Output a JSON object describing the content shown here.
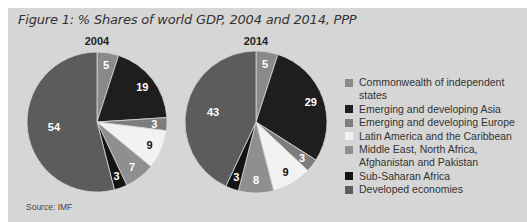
{
  "figure": {
    "title": "Figure 1: % Shares of world GDP, 2004 and 2014, PPP",
    "source": "Source: IMF"
  },
  "chart_data": [
    {
      "type": "pie",
      "title": "2004",
      "categories": [
        "Commonwealth of independent states",
        "Emerging and developing Asia",
        "Emerging and developing Europe",
        "Latin America and the Caribbean",
        "Middle East, North Africa, Afghanistan and Pakistan",
        "Sub-Saharan Africa",
        "Developed economies"
      ],
      "values": [
        5,
        19,
        3,
        9,
        7,
        3,
        54
      ],
      "unit": "% of world GDP (PPP)",
      "start_angle": "12 o'clock, clockwise"
    },
    {
      "type": "pie",
      "title": "2014",
      "categories": [
        "Commonwealth of independent states",
        "Emerging and developing Asia",
        "Emerging and developing Europe",
        "Latin America and the Caribbean",
        "Middle East, North Africa, Afghanistan and Pakistan",
        "Sub-Saharan Africa",
        "Developed economies"
      ],
      "values": [
        5,
        29,
        3,
        9,
        8,
        3,
        43
      ],
      "unit": "% of world GDP (PPP)",
      "start_angle": "12 o'clock, clockwise"
    }
  ],
  "legend": {
    "position": "right",
    "items": [
      {
        "label": "Commonwealth of independent states",
        "color": "#8a8a8a"
      },
      {
        "label": "Emerging and developing Asia",
        "color": "#1e1e1e"
      },
      {
        "label": "Emerging and developing Europe",
        "color": "#7d7d7d"
      },
      {
        "label": "Latin America and the Caribbean",
        "color": "#f2f2f2"
      },
      {
        "label": "Middle East, North Africa, Afghanistan and Pakistan",
        "color": "#8f8f8f"
      },
      {
        "label": "Sub-Saharan Africa",
        "color": "#141414"
      },
      {
        "label": "Developed economies",
        "color": "#5c5c5c"
      }
    ]
  },
  "pies": [
    {
      "year": "2004",
      "cx": 97,
      "cy": 122,
      "r": 70
    },
    {
      "year": "2014",
      "cx": 256,
      "cy": 122,
      "r": 71
    }
  ]
}
